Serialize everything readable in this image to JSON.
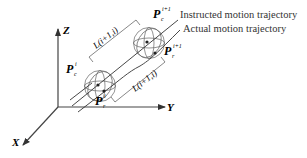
{
  "figure": {
    "type": "3d-trajectory-diagram",
    "axes": {
      "x": {
        "label": "X"
      },
      "y": {
        "label": "Y"
      },
      "z": {
        "label": "Z"
      }
    },
    "points": {
      "pc_i": {
        "base": "P",
        "sub": "c",
        "sup": "i"
      },
      "pr_i": {
        "base": "P",
        "sub": "r",
        "sup": "i"
      },
      "pc_i1": {
        "base": "P",
        "sub": "c",
        "sup": "i+1"
      },
      "pr_i1": {
        "base": "P",
        "sub": "r",
        "sup": "i+1"
      }
    },
    "distance_labels": {
      "top": "L(i+1,i)",
      "bottom": "L(i+1,i)"
    },
    "legend": {
      "instructed": "Instructed motion trajectory",
      "actual": "Actual motion trajectory"
    },
    "colors": {
      "line": "#333333",
      "sphere": "#555555",
      "background": "#ffffff"
    }
  }
}
